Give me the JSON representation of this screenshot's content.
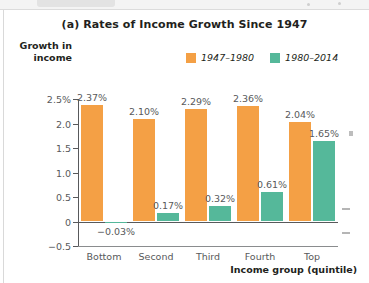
{
  "chart_data": {
    "type": "bar",
    "title": "(a) Rates of Income Growth Since 1947",
    "xlabel": "Income group (quintile)",
    "ylabel": "Growth in income",
    "categories": [
      "Bottom",
      "Second",
      "Third",
      "Fourth",
      "Top"
    ],
    "series": [
      {
        "name": "1947–1980",
        "color": "#F4A045",
        "values": [
          2.37,
          2.1,
          2.29,
          2.36,
          2.04
        ],
        "labels": [
          "2.37%",
          "2.10%",
          "2.29%",
          "2.36%",
          "2.04%"
        ]
      },
      {
        "name": "1980–2014",
        "color": "#55B89A",
        "values": [
          -0.03,
          0.17,
          0.32,
          0.61,
          1.65
        ],
        "labels": [
          "−0.03%",
          "0.17%",
          "0.32%",
          "0.61%",
          "1.65%"
        ]
      }
    ],
    "ytick_labels": [
      "2.5%",
      "2.0",
      "1.5",
      "1.0",
      "0.5",
      "0",
      "−0.5"
    ],
    "ytick_values": [
      2.5,
      2.0,
      1.5,
      1.0,
      0.5,
      0,
      -0.5
    ],
    "ylim": [
      -0.5,
      2.5
    ],
    "grid": false,
    "legend_position": "top-center"
  },
  "legend": {
    "entries": [
      {
        "label": "1947–1980",
        "color": "#F4A045"
      },
      {
        "label": "1980–2014",
        "color": "#55B89A"
      }
    ]
  },
  "axis": {
    "y_title_line1": "Growth in",
    "y_title_line2": "income",
    "x_title": "Income group (quintile)"
  }
}
